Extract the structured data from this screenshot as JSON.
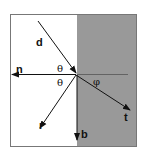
{
  "diagram": {
    "type": "reflection-refraction",
    "colors": {
      "medium": "#999999",
      "border": "#777777",
      "line": "#111111"
    },
    "labels": {
      "incident": "d",
      "normal": "n",
      "reflected": "r",
      "transmitted": "t",
      "bottom": "b",
      "incidence_angle": "θ",
      "reflection_angle": "θ",
      "refraction_angle": "φ"
    }
  }
}
